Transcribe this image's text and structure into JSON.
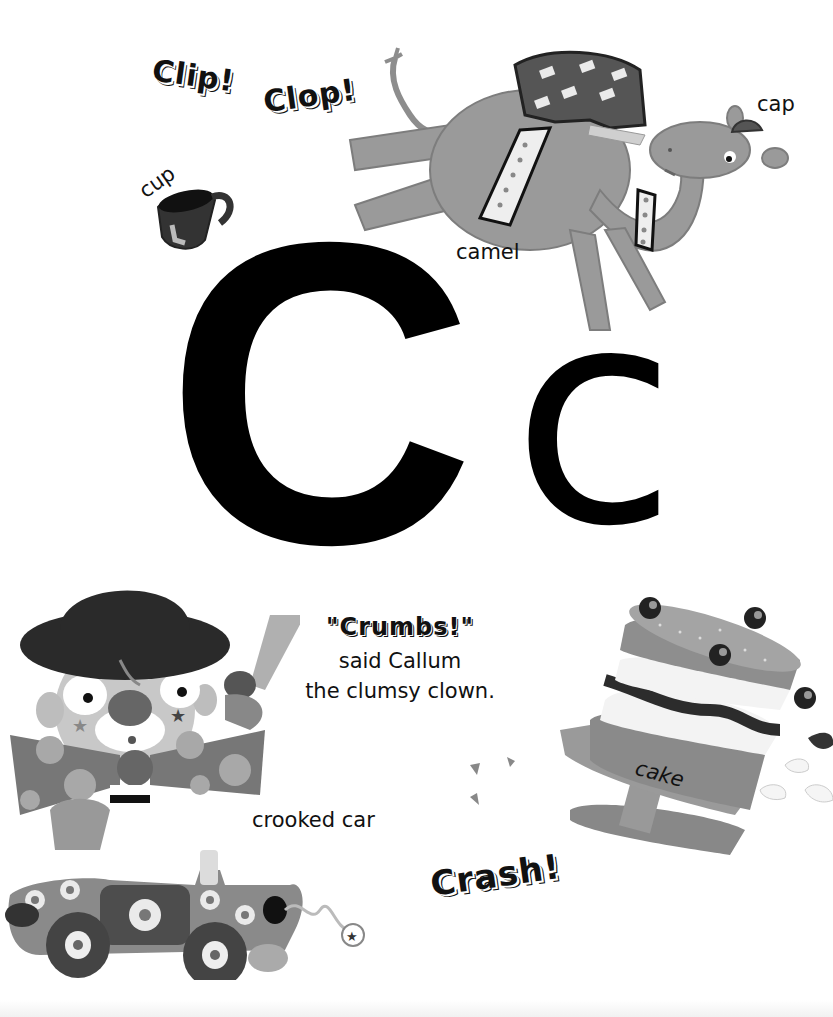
{
  "page": {
    "letter_upper": "C",
    "letter_lower": "c",
    "sound_effects": {
      "clip": "Clip!",
      "clop": "Clop!",
      "crash": "Crash!"
    },
    "labels": {
      "cup": "cup",
      "camel": "camel",
      "cap": "cap",
      "crooked_car": "crooked car",
      "cake": "cake"
    },
    "caption": {
      "quote": "\"Crumbs!\"",
      "line1": "said Callum",
      "line2": "the clumsy clown."
    },
    "illustrations": [
      "camel-illustration",
      "cup-illustration",
      "clown-illustration",
      "car-illustration",
      "cake-illustration"
    ]
  }
}
